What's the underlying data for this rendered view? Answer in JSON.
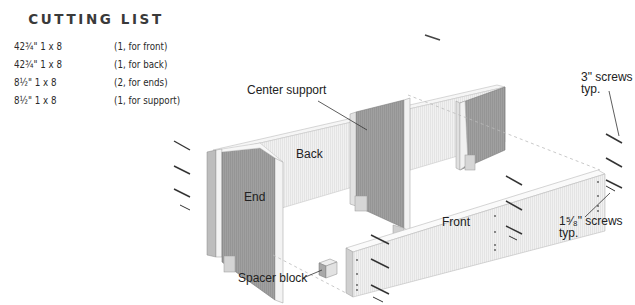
{
  "cutting_list": {
    "title": "CUTTING LIST",
    "rows": [
      {
        "size": "42¾\" 1 x 8",
        "use": "(1, for front)"
      },
      {
        "size": "42¾\" 1 x 8",
        "use": "(1, for back)"
      },
      {
        "size": "8½\" 1 x 8",
        "use": "(2, for ends)"
      },
      {
        "size": "8½\" 1 x 8",
        "use": "(1, for support)"
      }
    ]
  },
  "diagram": {
    "labels": {
      "center_support": "Center support",
      "back": "Back",
      "end": "End",
      "front": "Front",
      "spacer_block": "Spacer block",
      "screws_3_line1": "3\" screws",
      "screws_3_line2": "typ.",
      "screws_158_line1": "1⁵⁄₈\" screws",
      "screws_158_line2": "typ."
    },
    "colors": {
      "panel_light": "#ececec",
      "panel_face": "#f4f4f4",
      "panel_dark": "#9a9a9a",
      "edge": "#d8d8d8",
      "line": "#333333"
    }
  }
}
